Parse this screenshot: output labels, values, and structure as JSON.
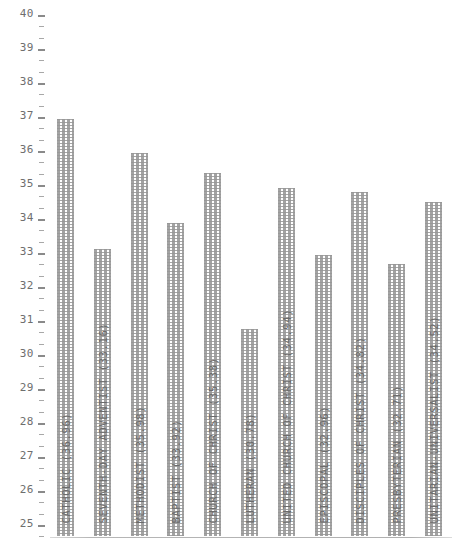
{
  "chart_data": {
    "type": "bar",
    "title": "",
    "subtitle": "",
    "xlabel": "",
    "ylabel": "",
    "ylim": [
      25,
      40
    ],
    "ytick_step": 1,
    "minor_ticks_per_major": 2,
    "grid": false,
    "legend": "none",
    "orientation": "vertical",
    "axis_color": "#8a8a8a",
    "bar_color": "#969696",
    "ytick_labels": [
      "40",
      "39",
      "38",
      "37",
      "36",
      "35",
      "34",
      "33",
      "32",
      "31",
      "30",
      "29",
      "28",
      "27",
      "26",
      "25"
    ],
    "categories": [
      "CATHOLIC",
      "SEVENTH-DAY ADVENTIST",
      "METHODIST",
      "BAPTIST",
      "CHURCH OF CHRIST",
      "LUTHERAN",
      "UNITED CHURCH OF CHRIST",
      "EPISCOPAL",
      "DISCIPLES OF CHRIST",
      "PRESBYTERIAN",
      "UNITARIAN-UNIVERSALIST"
    ],
    "values": [
      36.96,
      33.16,
      35.98,
      33.92,
      35.38,
      30.78,
      34.94,
      32.96,
      34.82,
      32.71,
      34.52
    ],
    "bar_labels": [
      "CATHOLIC (36.96)",
      "SEVENTH-DAY ADVENTIST (33.16)",
      "METHODIST (35.98)",
      "BAPTIST (33.92)",
      "CHURCH OF CHRIST (35.38)",
      "LUTHERAN (30.78)",
      "UNITED CHURCH OF CHRIST (34.94)",
      "EPISCOPAL (32.96)",
      "DISCIPLES OF CHRIST (34.82)",
      "PRESBYTERIAN (32.71)",
      "UNITARIAN-UNIVERSALIST (34.52)"
    ]
  }
}
